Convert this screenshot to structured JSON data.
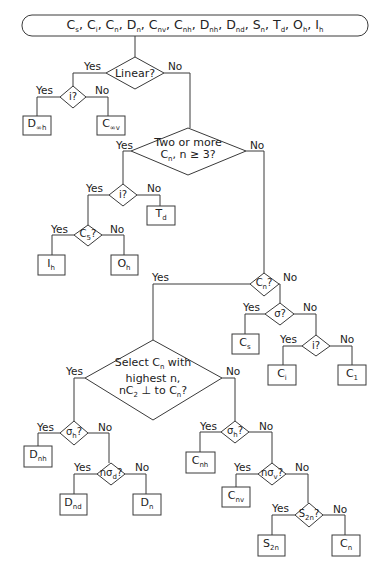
{
  "title_bar": {
    "groups": [
      {
        "base": "C",
        "sub": "s"
      },
      {
        "base": "C",
        "sub": "i"
      },
      {
        "base": "C",
        "sub": "n"
      },
      {
        "base": "D",
        "sub": "n"
      },
      {
        "base": "C",
        "sub": "nv"
      },
      {
        "base": "C",
        "sub": "nh"
      },
      {
        "base": "D",
        "sub": "nh"
      },
      {
        "base": "D",
        "sub": "nd"
      },
      {
        "base": "S",
        "sub": "n"
      },
      {
        "base": "T",
        "sub": "d"
      },
      {
        "base": "O",
        "sub": "h"
      },
      {
        "base": "I",
        "sub": "h"
      }
    ],
    "separator": ","
  },
  "branch": {
    "yes": "Yes",
    "no": "No"
  },
  "decisions": {
    "linear": "Linear?",
    "inv1": "i?",
    "two_or_more_line1": "Two or more",
    "two_or_more_line2_base": "C",
    "two_or_more_line2_sub": "n",
    "two_or_more_line2_rest": ", n ≥ 3?",
    "inv2": "i?",
    "c5": {
      "base": "C",
      "sub": "5",
      "q": "?"
    },
    "cn": {
      "base": "C",
      "sub": "n",
      "q": "?"
    },
    "sigma": "σ?",
    "inv3": "i?",
    "select_line1_pre": "Select C",
    "select_line1_sub": "n",
    "select_line1_post": " with",
    "select_line2": "highest n,",
    "select_line3_pre": "nC",
    "select_line3_sub": "2",
    "select_line3_mid": " ⊥ to C",
    "select_line3_sub2": "n",
    "select_line3_post": "?",
    "sigma_h_left": {
      "base": "σ",
      "sub": "h",
      "q": "?"
    },
    "n_sigma_d": {
      "base": "nσ",
      "sub": "d",
      "q": "?"
    },
    "sigma_h_right": {
      "base": "σ",
      "sub": "h",
      "q": "?"
    },
    "n_sigma_v": {
      "base": "nσ",
      "sub": "v",
      "q": "?"
    },
    "s2n": {
      "base": "S",
      "sub": "2n",
      "q": "?"
    }
  },
  "results": {
    "d_inf_h": {
      "base": "D",
      "sub": "∞h"
    },
    "c_inf_v": {
      "base": "C",
      "sub": "∞v"
    },
    "t_d": {
      "base": "T",
      "sub": "d"
    },
    "i_h": {
      "base": "I",
      "sub": "h"
    },
    "o_h": {
      "base": "O",
      "sub": "h"
    },
    "c_s": {
      "base": "C",
      "sub": "s"
    },
    "c_i": {
      "base": "C",
      "sub": "i"
    },
    "c_1": {
      "base": "C",
      "sub": "1"
    },
    "d_nh": {
      "base": "D",
      "sub": "nh"
    },
    "d_nd": {
      "base": "D",
      "sub": "nd"
    },
    "d_n": {
      "base": "D",
      "sub": "n"
    },
    "c_nh": {
      "base": "C",
      "sub": "nh"
    },
    "c_nv": {
      "base": "C",
      "sub": "nv"
    },
    "s_2n": {
      "base": "S",
      "sub": "2n"
    },
    "c_n": {
      "base": "C",
      "sub": "n"
    }
  }
}
